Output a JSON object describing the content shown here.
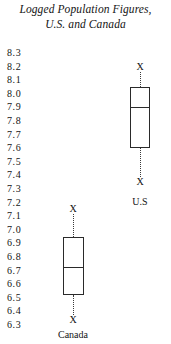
{
  "title": {
    "line1": "Logged Population Figures,",
    "line2": "U.S. and Canada"
  },
  "axis": {
    "ticks": [
      "8.3",
      "8.2",
      "8.1",
      "8.0",
      "7.9",
      "7.8",
      "7.7",
      "7.6",
      "7.5",
      "7.4",
      "7.3",
      "7.2",
      "7.1",
      "7.0",
      "6.9",
      "6.8",
      "6.7",
      "6.6",
      "6.5",
      "6.4",
      "6.3"
    ]
  },
  "groups": {
    "us": {
      "label": "U.S",
      "marker_upper": "X",
      "marker_lower": "X"
    },
    "canada": {
      "label": "Canada",
      "marker_upper": "X",
      "marker_lower": "X"
    }
  },
  "chart_data": {
    "type": "boxplot",
    "title": "Logged Population Figures, U.S. and Canada",
    "xlabel": "",
    "ylabel": "",
    "ylim": [
      6.3,
      8.3
    ],
    "ytick_step": 0.1,
    "yticks": [
      8.3,
      8.2,
      8.1,
      8.0,
      7.9,
      7.8,
      7.7,
      7.6,
      7.5,
      7.4,
      7.3,
      7.2,
      7.1,
      7.0,
      6.9,
      6.8,
      6.7,
      6.6,
      6.5,
      6.4,
      6.3
    ],
    "grid": false,
    "legend": "none",
    "whisker_style": "dotted",
    "whisker_cap_marker": "X",
    "categories": [
      "Canada",
      "U.S"
    ],
    "series": [
      {
        "name": "Canada",
        "whisker_low": 6.34,
        "q1": 6.52,
        "median": 6.73,
        "q3": 6.95,
        "whisker_high": 7.15
      },
      {
        "name": "U.S",
        "whisker_low": 7.35,
        "q1": 7.6,
        "median": 7.9,
        "q3": 8.05,
        "whisker_high": 8.2
      }
    ]
  }
}
